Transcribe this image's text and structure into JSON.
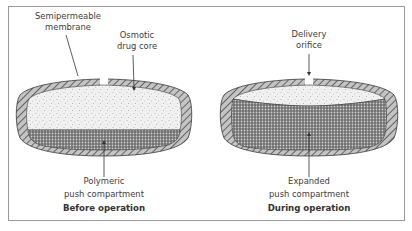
{
  "figure": {
    "colors": {
      "frame_border": "#9a9a9a",
      "membrane_fill": "#bdbdbd",
      "membrane_hatch": "#4a4a4a",
      "outline": "#3a3a3a",
      "drug_core_bg": "#efefef",
      "push_compartment_bg": "#7a7a7a",
      "text": "#3c3c3c"
    },
    "panels": [
      {
        "id": "before",
        "caption": "Before operation",
        "labels": {
          "membrane": [
            "Semipermeable",
            "membrane"
          ],
          "drug_core": [
            "Osmotic",
            "drug core"
          ],
          "push": [
            "Polymeric",
            "push compartment"
          ]
        }
      },
      {
        "id": "during",
        "caption": "During operation",
        "labels": {
          "orifice": [
            "Delivery",
            "orifice"
          ],
          "push": [
            "Expanded",
            "push compartment"
          ]
        }
      }
    ]
  }
}
